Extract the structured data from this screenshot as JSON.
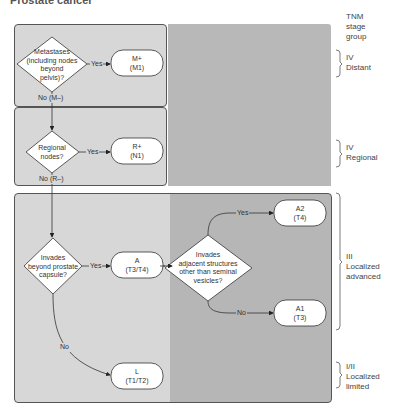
{
  "title": "Prostate cancer",
  "stage_header": [
    "TNM",
    "stage",
    "group"
  ],
  "decisions": {
    "metastases": [
      "Metastases",
      "(including nodes",
      "beyond",
      "pelvis)?"
    ],
    "regional": [
      "Regional",
      "nodes?"
    ],
    "invades_capsule": [
      "Invades",
      "beyond prostate",
      "capsule?"
    ],
    "invades_adjacent": [
      "Invades",
      "adjacent structures",
      "other than seminal",
      "vesicles?"
    ]
  },
  "outcomes": {
    "m_plus": [
      "M+",
      "(M1)"
    ],
    "r_plus": [
      "R+",
      "(N1)"
    ],
    "a": [
      "A",
      "(T3/T4)"
    ],
    "a2": [
      "A2",
      "(T4)"
    ],
    "a1": [
      "A1",
      "(T3)"
    ],
    "l": [
      "L",
      "(T1/T2)"
    ]
  },
  "edge_labels": {
    "yes": "Yes",
    "no": "No",
    "no_m": "No (M–)",
    "no_r": "No (R–)"
  },
  "stages": [
    {
      "roman": "IV",
      "name": "Distant"
    },
    {
      "roman": "IV",
      "name": "Regional"
    },
    {
      "roman": "III",
      "name": "Localized",
      "name2": "advanced"
    },
    {
      "roman": "I/II",
      "name": "Localized",
      "name2": "limited"
    }
  ],
  "colors": {
    "panel_light": "#d7d7d7",
    "panel_dark": "#b6b6b6",
    "stroke": "#333333",
    "node_fill": "#ffffff"
  }
}
